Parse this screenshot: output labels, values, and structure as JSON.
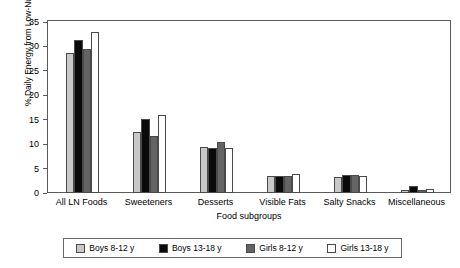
{
  "chart_data": {
    "type": "bar",
    "title": "",
    "xlabel": "Food subgroups",
    "ylabel": "% Daily Energy from Low-Nutrient Foods",
    "ylim": [
      0,
      35
    ],
    "yticks": [
      0,
      5,
      10,
      15,
      20,
      25,
      30,
      35
    ],
    "grid": false,
    "legend_position": "bottom",
    "categories": [
      "All LN Foods",
      "Sweeteners",
      "Desserts",
      "Visible Fats",
      "Salty Snacks",
      "Miscellaneous"
    ],
    "series": [
      {
        "name": "Boys 8-12 y",
        "color": "#c8c8c8",
        "values": [
          28.6,
          12.4,
          9.5,
          3.5,
          3.3,
          0.6
        ]
      },
      {
        "name": "Boys 13-18 y",
        "color": "#0a0a0a",
        "values": [
          31.3,
          15.1,
          9.2,
          3.4,
          3.6,
          1.5
        ]
      },
      {
        "name": "Girls 8-12 y",
        "color": "#646464",
        "values": [
          29.4,
          11.7,
          10.5,
          3.5,
          3.7,
          0.7
        ]
      },
      {
        "name": "Girls 13-18 y",
        "color": "#ffffff",
        "values": [
          33.0,
          15.9,
          9.3,
          3.9,
          3.5,
          0.9
        ]
      }
    ]
  }
}
